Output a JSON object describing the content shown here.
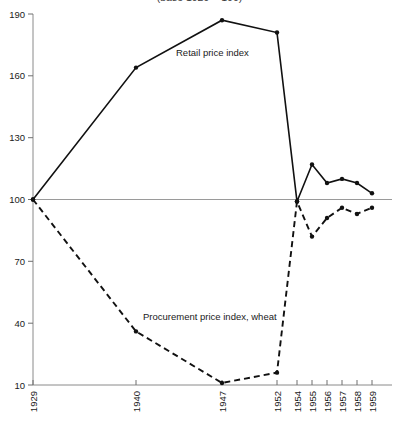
{
  "chart_data": {
    "type": "line",
    "title": "(base 1929 = 100)",
    "xlabel": "",
    "ylabel": "",
    "ylim": [
      10,
      190
    ],
    "yticks": [
      10,
      40,
      70,
      100,
      130,
      160,
      190
    ],
    "grid": false,
    "baseline": 100,
    "legend_position": "inline-annotation",
    "categories": [
      "1929",
      "1940",
      "1947",
      "1952",
      "1954",
      "1955",
      "1956",
      "1957",
      "1958",
      "1959"
    ],
    "series": [
      {
        "name": "Retail price index",
        "style": "solid",
        "values": [
          100,
          164,
          187,
          181,
          99,
          117,
          108,
          110,
          108,
          103
        ]
      },
      {
        "name": "Procurement price index, wheat",
        "style": "dashed",
        "values": [
          100,
          36,
          11,
          16,
          99,
          82,
          91,
          96,
          93,
          96
        ]
      }
    ],
    "annotations": [
      {
        "name": "retail-series-label",
        "text": "Retail price index",
        "x": 176,
        "y": 56
      },
      {
        "name": "procurement-series-label",
        "text": "Procurement price index, wheat",
        "x": 143,
        "y": 320
      }
    ]
  },
  "axes": {
    "y_tick_labels": [
      "190",
      "160",
      "130",
      "100",
      "70",
      "40",
      "10"
    ],
    "x_tick_labels": [
      "1929",
      "1940",
      "1947",
      "1952",
      "1954",
      "1955",
      "1956",
      "1957",
      "1958",
      "1959"
    ]
  },
  "colors": {
    "line": "#111111",
    "axis": "#8a8a8a",
    "baseline": "#9a9a9a",
    "text": "#1a1a1a",
    "background": "#ffffff"
  }
}
